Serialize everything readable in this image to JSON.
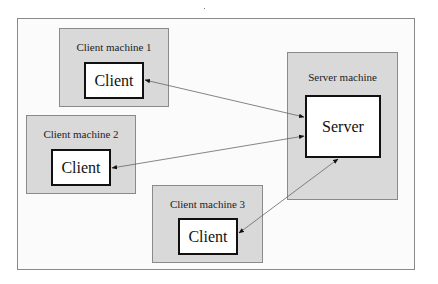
{
  "diagram": {
    "title": "",
    "colors": {
      "machine_fill": "#d9d9d9",
      "frame_border": "#8a8a8a",
      "process_border": "#111111",
      "arrow": "#555555"
    },
    "machines": [
      {
        "id": "client-machine-1",
        "label": "Client machine 1",
        "process": "Client"
      },
      {
        "id": "client-machine-2",
        "label": "Client machine 2",
        "process": "Client"
      },
      {
        "id": "client-machine-3",
        "label": "Client machine 3",
        "process": "Client"
      },
      {
        "id": "server-machine",
        "label": "Server machine",
        "process": "Server"
      }
    ],
    "connections": [
      {
        "from": "Client (Client machine 1)",
        "to": "Server",
        "direction": "bidirectional"
      },
      {
        "from": "Client (Client machine 2)",
        "to": "Server",
        "direction": "bidirectional"
      },
      {
        "from": "Client (Client machine 3)",
        "to": "Server",
        "direction": "bidirectional"
      }
    ]
  }
}
